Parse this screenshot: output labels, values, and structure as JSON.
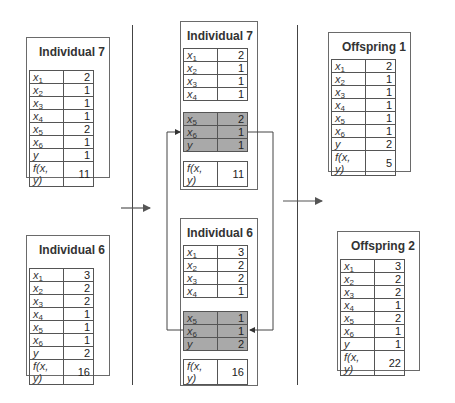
{
  "parents": [
    {
      "title": "Individual 7",
      "rows": [
        {
          "var": "x",
          "sub": "1",
          "value": "2"
        },
        {
          "var": "x",
          "sub": "2",
          "value": "1"
        },
        {
          "var": "x",
          "sub": "3",
          "value": "1"
        },
        {
          "var": "x",
          "sub": "4",
          "value": "1"
        },
        {
          "var": "x",
          "sub": "5",
          "value": "2"
        },
        {
          "var": "x",
          "sub": "6",
          "value": "1"
        },
        {
          "var": "y",
          "sub": "",
          "value": "1"
        },
        {
          "var": "f(x, y)",
          "sub": "",
          "value": "11"
        }
      ]
    },
    {
      "title": "Individual 6",
      "rows": [
        {
          "var": "x",
          "sub": "1",
          "value": "3"
        },
        {
          "var": "x",
          "sub": "2",
          "value": "2"
        },
        {
          "var": "x",
          "sub": "3",
          "value": "2"
        },
        {
          "var": "x",
          "sub": "4",
          "value": "1"
        },
        {
          "var": "x",
          "sub": "5",
          "value": "1"
        },
        {
          "var": "x",
          "sub": "6",
          "value": "1"
        },
        {
          "var": "y",
          "sub": "",
          "value": "2"
        },
        {
          "var": "f(x, y)",
          "sub": "",
          "value": "16"
        }
      ]
    }
  ],
  "crossover": [
    {
      "title": "Individual 7",
      "kept": [
        {
          "var": "x",
          "sub": "1",
          "value": "2"
        },
        {
          "var": "x",
          "sub": "2",
          "value": "1"
        },
        {
          "var": "x",
          "sub": "3",
          "value": "1"
        },
        {
          "var": "x",
          "sub": "4",
          "value": "1"
        }
      ],
      "swapped": [
        {
          "var": "x",
          "sub": "5",
          "value": "2"
        },
        {
          "var": "x",
          "sub": "6",
          "value": "1"
        },
        {
          "var": "y",
          "sub": "",
          "value": "1"
        }
      ],
      "fitness": {
        "var": "f(x, y)",
        "value": "11"
      }
    },
    {
      "title": "Individual 6",
      "kept": [
        {
          "var": "x",
          "sub": "1",
          "value": "3"
        },
        {
          "var": "x",
          "sub": "2",
          "value": "2"
        },
        {
          "var": "x",
          "sub": "3",
          "value": "2"
        },
        {
          "var": "x",
          "sub": "4",
          "value": "1"
        }
      ],
      "swapped": [
        {
          "var": "x",
          "sub": "5",
          "value": "1"
        },
        {
          "var": "x",
          "sub": "6",
          "value": "1"
        },
        {
          "var": "y",
          "sub": "",
          "value": "2"
        }
      ],
      "fitness": {
        "var": "f(x, y)",
        "value": "16"
      }
    }
  ],
  "offspring": [
    {
      "title": "Offspring 1",
      "rows": [
        {
          "var": "x",
          "sub": "1",
          "value": "2"
        },
        {
          "var": "x",
          "sub": "2",
          "value": "1"
        },
        {
          "var": "x",
          "sub": "3",
          "value": "1"
        },
        {
          "var": "x",
          "sub": "4",
          "value": "1"
        },
        {
          "var": "x",
          "sub": "5",
          "value": "1"
        },
        {
          "var": "x",
          "sub": "6",
          "value": "1"
        },
        {
          "var": "y",
          "sub": "",
          "value": "2"
        },
        {
          "var": "f(x, y)",
          "sub": "",
          "value": "5"
        }
      ]
    },
    {
      "title": "Offspring 2",
      "rows": [
        {
          "var": "x",
          "sub": "1",
          "value": "3"
        },
        {
          "var": "x",
          "sub": "2",
          "value": "2"
        },
        {
          "var": "x",
          "sub": "3",
          "value": "2"
        },
        {
          "var": "x",
          "sub": "4",
          "value": "1"
        },
        {
          "var": "x",
          "sub": "5",
          "value": "2"
        },
        {
          "var": "x",
          "sub": "6",
          "value": "1"
        },
        {
          "var": "y",
          "sub": "",
          "value": "1"
        },
        {
          "var": "f(x, y)",
          "sub": "",
          "value": "22"
        }
      ]
    }
  ],
  "colors": {
    "shaded_rows": "#a9a9a9",
    "lines": "#444444"
  }
}
